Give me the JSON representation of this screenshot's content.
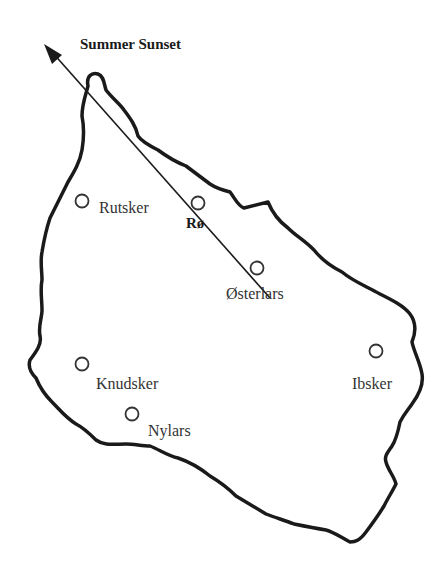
{
  "diagram": {
    "title": "Summer Sunset",
    "colors": {
      "outline": "#1a1a1a",
      "line": "#1a1a1a",
      "text": "#333333",
      "background": "#ffffff"
    },
    "places": [
      {
        "name": "Rutsker",
        "x": 82,
        "y": 201
      },
      {
        "name": "Rø",
        "x": 198,
        "y": 203,
        "bold": true
      },
      {
        "name": "Østerlars",
        "x": 257,
        "y": 268
      },
      {
        "name": "Knudsker",
        "x": 82,
        "y": 364
      },
      {
        "name": "Nylars",
        "x": 132,
        "y": 414
      },
      {
        "name": "Ibsker",
        "x": 376,
        "y": 351
      }
    ],
    "sunset_line": {
      "from": [
        270,
        298
      ],
      "to": [
        47,
        46
      ],
      "label": "Summer Sunset"
    }
  }
}
